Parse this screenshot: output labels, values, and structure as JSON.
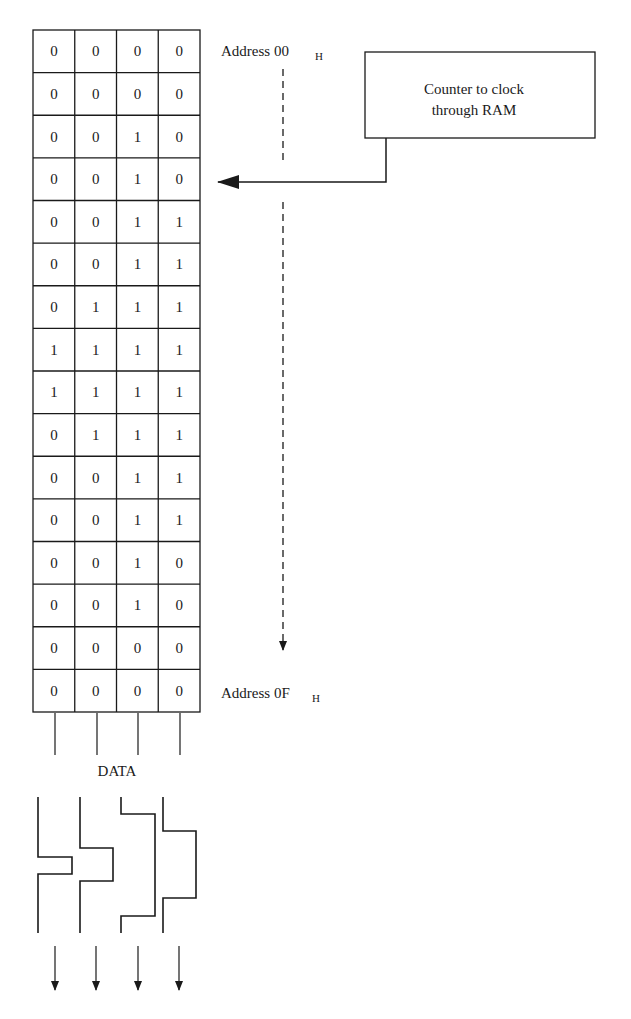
{
  "header_fragment": "p                      y g",
  "ram": {
    "columns": 4,
    "rows": [
      [
        "0",
        "0",
        "0",
        "0"
      ],
      [
        "0",
        "0",
        "0",
        "0"
      ],
      [
        "0",
        "0",
        "1",
        "0"
      ],
      [
        "0",
        "0",
        "1",
        "0"
      ],
      [
        "0",
        "0",
        "1",
        "1"
      ],
      [
        "0",
        "0",
        "1",
        "1"
      ],
      [
        "0",
        "1",
        "1",
        "1"
      ],
      [
        "1",
        "1",
        "1",
        "1"
      ],
      [
        "1",
        "1",
        "1",
        "1"
      ],
      [
        "0",
        "1",
        "1",
        "1"
      ],
      [
        "0",
        "0",
        "1",
        "1"
      ],
      [
        "0",
        "0",
        "1",
        "1"
      ],
      [
        "0",
        "0",
        "1",
        "0"
      ],
      [
        "0",
        "0",
        "1",
        "0"
      ],
      [
        "0",
        "0",
        "0",
        "0"
      ],
      [
        "0",
        "0",
        "0",
        "0"
      ]
    ],
    "start_address": "Address 00",
    "start_address_sub": "H",
    "end_address": "Address 0F",
    "end_address_sub": "H"
  },
  "counter_box": {
    "line1": "Counter to clock",
    "line2": "through RAM"
  },
  "data_label": "DATA",
  "colors": {
    "ink": "#1a1a1a",
    "background": "#ffffff"
  }
}
